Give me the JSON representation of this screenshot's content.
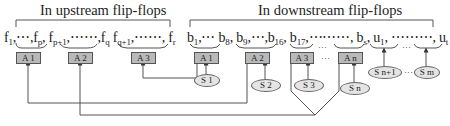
{
  "diagram": {
    "upstream_title": "In upstream flip-flops",
    "downstream_title": "In downstream flip-flops",
    "upstream_sequence": [
      {
        "base": "f",
        "sub": "1",
        "sep": ",⋯,"
      },
      {
        "base": "f",
        "sub": "p",
        "sep": ", "
      },
      {
        "base": "f",
        "sub": "p+1",
        "sep": ",⋯⋯,"
      },
      {
        "base": "f",
        "sub": "q",
        "sep": " "
      },
      {
        "base": "f",
        "sub": "q+1",
        "sep": ",⋯⋯, "
      },
      {
        "base": "f",
        "sub": "r",
        "sep": ""
      }
    ],
    "downstream_sequence": [
      {
        "base": "b",
        "sub": "1",
        "sep": ",⋯ "
      },
      {
        "base": "b",
        "sub": "8",
        "sep": ", "
      },
      {
        "base": "b",
        "sub": "9",
        "sep": ",⋯,"
      },
      {
        "base": "b",
        "sub": "16",
        "sep": ", "
      },
      {
        "base": "b",
        "sub": "17",
        "sep": ",⋯⋯⋯, "
      },
      {
        "base": "b",
        "sub": "s",
        "sep": ", "
      },
      {
        "base": "u",
        "sub": "1",
        "sep": ", ⋯⋯⋯, "
      },
      {
        "base": "u",
        "sub": "t",
        "sep": ""
      }
    ],
    "upstream_groups": [
      {
        "label": "A 1"
      },
      {
        "label": "A 2"
      },
      {
        "label": "A 3"
      }
    ],
    "downstream_groups": [
      {
        "label": "A 1",
        "source": "S 1"
      },
      {
        "label": "A 2",
        "source": "S 2"
      },
      {
        "label": "A 3",
        "source": "S 3"
      },
      {
        "label": "A n",
        "source": "S n"
      }
    ],
    "unassigned_sources": [
      {
        "label": "S n+1"
      },
      {
        "label": "S m"
      }
    ],
    "ellipsis": "…",
    "connections": [
      {
        "from": "downstream A 1",
        "to": "upstream A 3"
      },
      {
        "from": "downstream A 2",
        "to": "upstream A 1"
      },
      {
        "from": "downstream A 3 + A n",
        "to": "upstream A 2"
      }
    ],
    "colors": {
      "box_fill": "#b9b9b9",
      "ellipse_fill": "#e4e4e4",
      "line": "#555555"
    }
  }
}
